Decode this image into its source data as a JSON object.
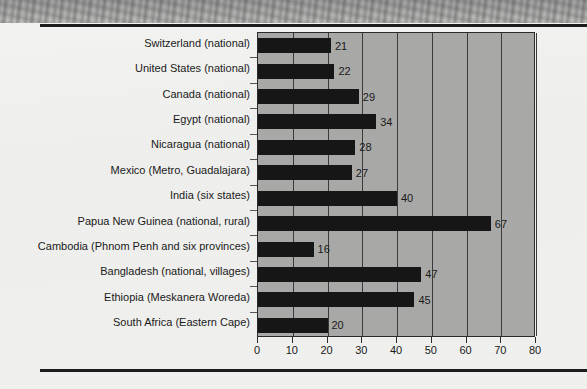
{
  "page": {
    "background_color": "#f2f2f0",
    "rule_color": "#1c1c1c"
  },
  "chart_data": {
    "type": "bar",
    "orientation": "horizontal",
    "title": "",
    "subtitle": "",
    "xlabel": "",
    "ylabel": "",
    "xlim": [
      0,
      80
    ],
    "xticks": [
      0,
      10,
      20,
      30,
      40,
      50,
      60,
      70,
      80
    ],
    "grid": true,
    "grid_axis": "x",
    "legend": false,
    "bar_color": "#161616",
    "plot_background_color": "#a8a8a6",
    "categories": [
      "Switzerland (national)",
      "United States (national)",
      "Canada (national)",
      "Egypt (national)",
      "Nicaragua (national)",
      "Mexico (Metro, Guadalajara)",
      "India (six states)",
      "Papua New Guinea (national, rural)",
      "Cambodia (Phnom Penh and six provinces)",
      "Bangladesh (national, villages)",
      "Ethiopia (Meskanera Woreda)",
      "South Africa (Eastern Cape)"
    ],
    "values": [
      21,
      22,
      29,
      34,
      28,
      27,
      40,
      67,
      16,
      47,
      45,
      20
    ],
    "value_labels": [
      "21",
      "22",
      "29",
      "34",
      "28",
      "27",
      "40",
      "67",
      "16",
      "47",
      "45",
      "20"
    ],
    "tick_labels": [
      "0",
      "10",
      "20",
      "30",
      "40",
      "50",
      "60",
      "70",
      "80"
    ]
  }
}
